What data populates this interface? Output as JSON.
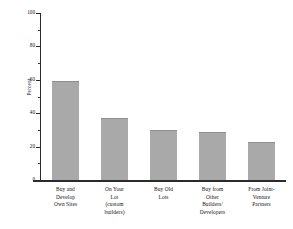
{
  "chart_data": {
    "type": "bar",
    "title": "",
    "subtitle": "",
    "xlabel": "",
    "ylabel": "Percent",
    "ylim": [
      0,
      100
    ],
    "yticks": [
      0,
      20,
      40,
      60,
      80,
      100
    ],
    "ytick_labels": [
      "0",
      "20",
      "40",
      "60",
      "80",
      "100"
    ],
    "grid": false,
    "legend": null,
    "bar_color": "#a9a9a9",
    "bar_edge_color": "#8f8f8f",
    "axis_color": "#2b2b2b",
    "background": "#ffffff",
    "categories": [
      "Buy and Develop Own Sites",
      "On Your Lot (custom builders)",
      "Buy Old Lots",
      "Buy from Other Builders/ Developers",
      "From Joint-Venture Partners"
    ],
    "category_lines": [
      [
        "Buy and",
        "Develop",
        "Own Sites"
      ],
      [
        "On Your",
        "Lot",
        "(custom",
        "builders)"
      ],
      [
        "Buy Old",
        "Lots"
      ],
      [
        "Buy from",
        "Other",
        "Builders/",
        "Developers"
      ],
      [
        "From Joint-",
        "Venture",
        "Partners"
      ]
    ],
    "values": [
      59,
      37,
      30,
      29,
      23
    ]
  }
}
